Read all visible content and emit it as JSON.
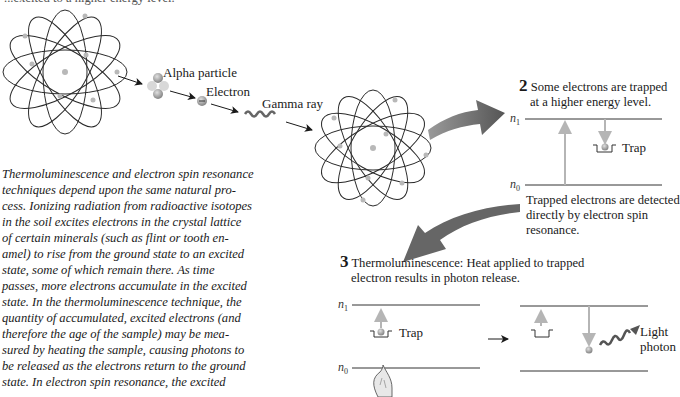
{
  "top_caption_fragment": "...excited to a higher energy level.",
  "step1": {
    "labels": {
      "alpha": "Alpha particle",
      "electron": "Electron",
      "gamma": "Gamma ray"
    }
  },
  "step2": {
    "number": "2",
    "caption_line1": "Some electrons are trapped",
    "caption_line2": "at a higher energy level.",
    "n1": "n",
    "n1_sub": "1",
    "n0": "n",
    "n0_sub": "0",
    "trap_label": "Trap",
    "esr_line1": "Trapped electrons are detected",
    "esr_line2": "directly by electron spin",
    "esr_line3": "resonance."
  },
  "step3": {
    "number": "3",
    "caption_line1": "Thermoluminescence: Heat applied to trapped",
    "caption_line2": "electron results in photon release.",
    "n1": "n",
    "n1_sub": "1",
    "n0": "n",
    "n0_sub": "0",
    "trap_label": "Trap",
    "photon_line1": "Light",
    "photon_line2": "photon"
  },
  "paragraph": {
    "lines": [
      "Thermoluminescence and electron spin resonance",
      "techniques depend upon the same natural pro-",
      "cess. Ionizing radiation from radioactive isotopes",
      "in the soil excites electrons in the crystal lattice",
      "of certain minerals (such as flint or tooth en-",
      "amel) to rise from the ground state to an excited",
      "state, some of which remain there. As time",
      "passes, more electrons accumulate in the excited",
      "state. In the thermoluminescence technique, the",
      "quantity of accumulated, excited electrons (and",
      "therefore the age of the sample) may be mea-",
      "sured by heating the sample, causing photons to",
      "be released as the electrons return to the ground",
      "state. In electron spin resonance, the excited"
    ]
  },
  "colors": {
    "orbit": "#2a2a2a",
    "electron_dot": "#b8b8b8",
    "big_arrow": "#666666",
    "energy_arrow": "#b5b5b5",
    "level_line": "#333333"
  }
}
